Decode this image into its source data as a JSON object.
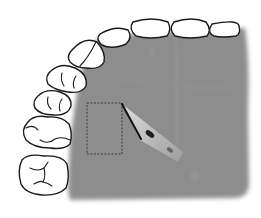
{
  "figure": {
    "colors": {
      "background": "#ffffff",
      "palate": "#8c8c8c",
      "palate_light": "#9a9a9a",
      "tooth_fill": "#ffffff",
      "outline": "#1a1a1a",
      "donor_site_outline": "#333333",
      "scalpel_blade": "#c8c8c8",
      "scalpel_edge": "#111111"
    },
    "teeth_count": 9,
    "donor_site": {
      "shape": "dashed-rectangle",
      "x": 87,
      "y": 103,
      "width": 35,
      "height": 51
    },
    "instrument": "scalpel"
  }
}
